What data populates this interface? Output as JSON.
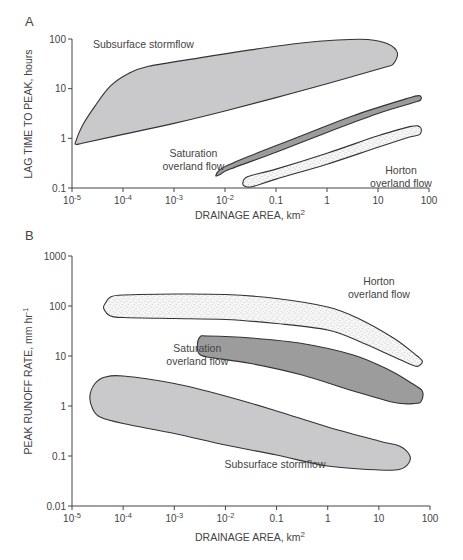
{
  "chart_data": [
    {
      "panel": "A",
      "type": "area",
      "title": "",
      "xlabel": "DRAINAGE AREA, km",
      "xlabel_sup": "2",
      "ylabel": "LAG TIME TO PEAK, hours",
      "xscale": "log",
      "yscale": "log",
      "xlim": [
        1e-05,
        100
      ],
      "ylim": [
        0.1,
        100
      ],
      "xticks": [
        {
          "base": "10",
          "exp": "-5"
        },
        {
          "base": "10",
          "exp": "-4"
        },
        {
          "base": "10",
          "exp": "-3"
        },
        {
          "base": "10",
          "exp": "-2"
        },
        {
          "base": "0.1",
          "exp": ""
        },
        {
          "base": "1",
          "exp": ""
        },
        {
          "base": "10",
          "exp": ""
        },
        {
          "base": "100",
          "exp": ""
        }
      ],
      "yticks": [
        "0.1",
        "1",
        "10",
        "100"
      ],
      "grid": false,
      "series": [
        {
          "name": "Subsurface stormflow",
          "fill": "#c9c9cc",
          "pattern": "solid",
          "label_lines": [
            "Subsurface stormflow"
          ],
          "label_pos": [
            -3.6,
            1.82
          ],
          "polygon_log10": [
            [
              -4.93,
              -0.07
            ],
            [
              -4.8,
              0.25
            ],
            [
              -4.55,
              0.65
            ],
            [
              -4.25,
              1.05
            ],
            [
              -3.9,
              1.3
            ],
            [
              -3.5,
              1.45
            ],
            [
              -2.5,
              1.62
            ],
            [
              -1.5,
              1.78
            ],
            [
              -0.5,
              1.92
            ],
            [
              0.2,
              1.98
            ],
            [
              0.8,
              1.99
            ],
            [
              1.2,
              1.9
            ],
            [
              1.38,
              1.72
            ],
            [
              1.3,
              1.5
            ],
            [
              1.1,
              1.42
            ],
            [
              0.0,
              1.1
            ],
            [
              -1.0,
              0.82
            ],
            [
              -2.0,
              0.55
            ],
            [
              -3.0,
              0.3
            ],
            [
              -4.0,
              0.08
            ],
            [
              -4.8,
              -0.1
            ],
            [
              -4.92,
              -0.12
            ]
          ]
        },
        {
          "name": "Saturation overland flow",
          "fill": "#9c9c9c",
          "pattern": "solid",
          "label_lines": [
            "Saturation",
            "overland flow"
          ],
          "label_pos": [
            -2.62,
            -0.38
          ],
          "polygon_log10": [
            [
              -2.18,
              -0.75
            ],
            [
              -2.05,
              -0.6
            ],
            [
              -1.5,
              -0.35
            ],
            [
              -0.5,
              0.05
            ],
            [
              0.5,
              0.45
            ],
            [
              1.5,
              0.78
            ],
            [
              1.8,
              0.86
            ],
            [
              1.84,
              0.78
            ],
            [
              1.7,
              0.72
            ],
            [
              1.0,
              0.5
            ],
            [
              0.0,
              0.12
            ],
            [
              -1.0,
              -0.28
            ],
            [
              -1.9,
              -0.62
            ],
            [
              -2.1,
              -0.73
            ]
          ]
        },
        {
          "name": "Horton overland flow",
          "fill": "#f4f4f4",
          "pattern": "stipple",
          "label_lines": [
            "Horton",
            "overland flow"
          ],
          "label_pos": [
            1.45,
            -0.72
          ],
          "polygon_log10": [
            [
              -1.65,
              -0.9
            ],
            [
              -1.55,
              -0.77
            ],
            [
              -1.0,
              -0.62
            ],
            [
              0.0,
              -0.3
            ],
            [
              1.0,
              0.05
            ],
            [
              1.65,
              0.24
            ],
            [
              1.83,
              0.22
            ],
            [
              1.82,
              0.08
            ],
            [
              1.6,
              0.02
            ],
            [
              1.0,
              -0.18
            ],
            [
              0.0,
              -0.52
            ],
            [
              -1.0,
              -0.82
            ],
            [
              -1.45,
              -0.97
            ],
            [
              -1.6,
              -0.97
            ]
          ]
        }
      ]
    },
    {
      "panel": "B",
      "type": "area",
      "title": "",
      "xlabel": "DRAINAGE AREA, km",
      "xlabel_sup": "2",
      "ylabel": "PEAK RUNOFF RATE, mm hr",
      "ylabel_sup": "-1",
      "xscale": "log",
      "yscale": "log",
      "xlim": [
        1e-05,
        100
      ],
      "ylim": [
        0.01,
        1000
      ],
      "xticks": [
        {
          "base": "10",
          "exp": "-5"
        },
        {
          "base": "10",
          "exp": "-4"
        },
        {
          "base": "10",
          "exp": "-3"
        },
        {
          "base": "10",
          "exp": "-2"
        },
        {
          "base": "0.1",
          "exp": ""
        },
        {
          "base": "1",
          "exp": ""
        },
        {
          "base": "10",
          "exp": ""
        },
        {
          "base": "100",
          "exp": ""
        }
      ],
      "yticks": [
        "0.01",
        "0.1",
        "1",
        "10",
        "100",
        "1000"
      ],
      "grid": false,
      "series": [
        {
          "name": "Horton overland flow",
          "fill": "#f4f4f4",
          "pattern": "stipple",
          "label_lines": [
            "Horton",
            "overland flow"
          ],
          "label_pos": [
            1.0,
            2.42
          ],
          "polygon_log10": [
            [
              -4.35,
              2.05
            ],
            [
              -4.25,
              2.18
            ],
            [
              -4.0,
              2.22
            ],
            [
              -3.0,
              2.24
            ],
            [
              -2.0,
              2.23
            ],
            [
              -1.0,
              2.15
            ],
            [
              0.0,
              1.98
            ],
            [
              0.6,
              1.75
            ],
            [
              1.3,
              1.35
            ],
            [
              1.75,
              1.0
            ],
            [
              1.85,
              0.9
            ],
            [
              1.8,
              0.82
            ],
            [
              1.7,
              0.8
            ],
            [
              1.3,
              0.98
            ],
            [
              0.6,
              1.3
            ],
            [
              0.0,
              1.52
            ],
            [
              -1.0,
              1.65
            ],
            [
              -2.0,
              1.73
            ],
            [
              -3.0,
              1.75
            ],
            [
              -4.0,
              1.77
            ],
            [
              -4.25,
              1.8
            ],
            [
              -4.38,
              1.95
            ]
          ]
        },
        {
          "name": "Saturation overland flow",
          "fill": "#9c9c9c",
          "pattern": "solid",
          "label_lines": [
            "Saturation",
            "overland flow"
          ],
          "label_pos": [
            -2.55,
            1.08
          ],
          "polygon_log10": [
            [
              -2.55,
              1.18
            ],
            [
              -2.5,
              1.38
            ],
            [
              -2.35,
              1.4
            ],
            [
              -1.5,
              1.36
            ],
            [
              -0.5,
              1.25
            ],
            [
              0.5,
              1.02
            ],
            [
              1.2,
              0.72
            ],
            [
              1.65,
              0.45
            ],
            [
              1.85,
              0.3
            ],
            [
              1.83,
              0.1
            ],
            [
              1.7,
              0.05
            ],
            [
              1.3,
              0.07
            ],
            [
              0.5,
              0.3
            ],
            [
              -0.5,
              0.62
            ],
            [
              -1.5,
              0.85
            ],
            [
              -2.3,
              0.97
            ],
            [
              -2.5,
              1.03
            ]
          ]
        },
        {
          "name": "Subsurface stormflow",
          "fill": "#c9c9cc",
          "pattern": "solid",
          "label_lines": [
            "Subsurface stormflow"
          ],
          "label_pos": [
            -1.03,
            -1.23
          ],
          "polygon_log10": [
            [
              -4.65,
              0.2
            ],
            [
              -4.55,
              0.45
            ],
            [
              -4.35,
              0.58
            ],
            [
              -4.0,
              0.6
            ],
            [
              -3.0,
              0.45
            ],
            [
              -2.0,
              0.2
            ],
            [
              -1.0,
              -0.1
            ],
            [
              0.0,
              -0.42
            ],
            [
              1.0,
              -0.7
            ],
            [
              1.4,
              -0.8
            ],
            [
              1.6,
              -0.98
            ],
            [
              1.58,
              -1.15
            ],
            [
              1.4,
              -1.27
            ],
            [
              1.0,
              -1.28
            ],
            [
              0.0,
              -1.2
            ],
            [
              -1.0,
              -0.98
            ],
            [
              -2.0,
              -0.78
            ],
            [
              -3.0,
              -0.55
            ],
            [
              -4.0,
              -0.35
            ],
            [
              -4.45,
              -0.22
            ],
            [
              -4.6,
              -0.05
            ]
          ]
        }
      ]
    }
  ],
  "figure": {
    "panel_a_label": "A",
    "panel_b_label": "B"
  }
}
